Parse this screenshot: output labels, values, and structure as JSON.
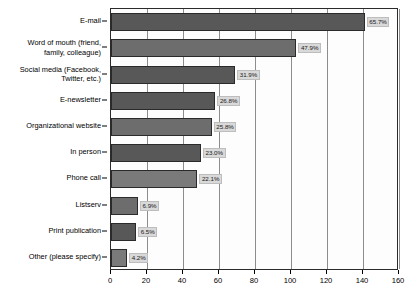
{
  "chart_data": {
    "type": "bar",
    "orientation": "horizontal",
    "title": "",
    "subtitle": "",
    "xlabel": "",
    "ylabel": "",
    "xlim": [
      0,
      160
    ],
    "xticks": [
      0,
      20,
      40,
      60,
      80,
      100,
      120,
      140,
      160
    ],
    "xtick_labels": [
      "0",
      "20",
      "40",
      "60",
      "80",
      "100",
      "120",
      "140",
      "160"
    ],
    "grid": "vertical",
    "legend": "none",
    "categories": [
      "E-mail",
      "Word of mouth (friend,\nfamily, colleague)",
      "Social media (Facebook,\nTwitter, etc.)",
      "E-newsletter",
      "Organizational website",
      "In person",
      "Phone call",
      "Listserv",
      "Print publication",
      "Other (please specify)"
    ],
    "values": [
      141,
      103,
      69,
      58,
      56,
      50,
      48,
      15,
      14,
      9
    ],
    "data_labels": [
      "65.7%",
      "47.9%",
      "31.9%",
      "26.8%",
      "25.8%",
      "23.0%",
      "22.1%",
      "6.9%",
      "6.5%",
      "4.2%"
    ],
    "percentages": [
      65.7,
      47.9,
      31.9,
      26.8,
      25.8,
      23.0,
      22.1,
      6.9,
      6.5,
      4.2
    ],
    "bars": [
      {
        "category": "E-mail",
        "value": 141,
        "label": "65.7%"
      },
      {
        "category": "Word of mouth (friend, family, colleague)",
        "value": 103,
        "label": "47.9%"
      },
      {
        "category": "Social media (Facebook, Twitter, etc.)",
        "value": 69,
        "label": "31.9%"
      },
      {
        "category": "E-newsletter",
        "value": 58,
        "label": "26.8%"
      },
      {
        "category": "Organizational website",
        "value": 56,
        "label": "25.8%"
      },
      {
        "category": "In person",
        "value": 50,
        "label": "23.0%"
      },
      {
        "category": "Phone call",
        "value": 48,
        "label": "22.1%"
      },
      {
        "category": "Listserv",
        "value": 15,
        "label": "6.9%"
      },
      {
        "category": "Print publication",
        "value": 14,
        "label": "6.5%"
      },
      {
        "category": "Other (please specify)",
        "value": 9,
        "label": "4.2%"
      }
    ],
    "colors": {
      "bar_fill": "#585858",
      "bar_edge": "#2a2a2a",
      "label_box": "#d9d9d9",
      "grid": "#8d8d8d",
      "axis": "#2b2b2b",
      "background": "#ffffff",
      "text": "#000000"
    }
  }
}
